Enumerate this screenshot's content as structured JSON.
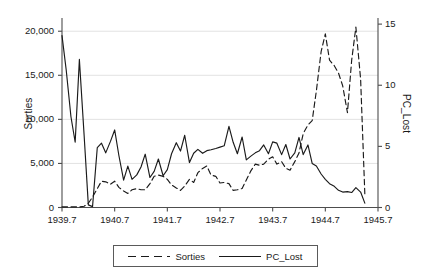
{
  "chart_data": {
    "type": "line",
    "title": "",
    "subtitle": "",
    "xlabel": "",
    "ylabel": "Sorties",
    "y2label": "PC_Lost",
    "xlim": [
      1939.7,
      1945.7
    ],
    "ylim": [
      0,
      21500
    ],
    "y2lim": [
      0,
      15.5
    ],
    "grid": true,
    "grid_axis": "y",
    "legend_position": "bottom-outside",
    "xticks": [
      "1939.7",
      "1940.7",
      "1941.7",
      "1942.7",
      "1943.7",
      "1944.7",
      "1945.7"
    ],
    "xtick_values": [
      1939.7,
      1940.7,
      1941.7,
      1942.7,
      1943.7,
      1944.7,
      1945.7
    ],
    "yticks": [
      "0",
      "5,000",
      "10,000",
      "15,000",
      "20,000"
    ],
    "ytick_values": [
      0,
      5000,
      10000,
      15000,
      20000
    ],
    "y2ticks": [
      "0",
      "5",
      "10",
      "15"
    ],
    "y2tick_values": [
      0,
      5,
      10,
      15
    ],
    "series": [
      {
        "name": "Sorties",
        "axis": "right",
        "style": "dashed",
        "color": "#1a1a1a",
        "x": [
          1939.7,
          1939.78,
          1939.87,
          1939.95,
          1940.03,
          1940.12,
          1940.2,
          1940.28,
          1940.37,
          1940.45,
          1940.53,
          1940.62,
          1940.7,
          1940.78,
          1940.87,
          1940.95,
          1941.03,
          1941.12,
          1941.2,
          1941.28,
          1941.37,
          1941.45,
          1941.53,
          1941.62,
          1941.7,
          1941.78,
          1941.87,
          1941.95,
          1942.03,
          1942.12,
          1942.2,
          1942.28,
          1942.37,
          1942.45,
          1942.53,
          1942.62,
          1942.7,
          1942.78,
          1942.87,
          1942.95,
          1943.03,
          1943.12,
          1943.2,
          1943.28,
          1943.37,
          1943.45,
          1943.53,
          1943.62,
          1943.7,
          1943.78,
          1943.87,
          1943.95,
          1944.03,
          1944.12,
          1944.2,
          1944.28,
          1944.37,
          1944.45,
          1944.53,
          1944.62,
          1944.7,
          1944.78,
          1944.87,
          1944.95,
          1945.03,
          1945.12,
          1945.2,
          1945.28,
          1945.37,
          1945.45
        ],
        "values": [
          0.05,
          0.05,
          0.05,
          0.05,
          0.05,
          0.1,
          0.35,
          0.85,
          1.55,
          2.15,
          2.1,
          1.9,
          2.15,
          1.65,
          1.35,
          1.15,
          1.45,
          1.55,
          1.45,
          1.45,
          1.95,
          2.55,
          2.65,
          2.55,
          2.3,
          1.85,
          1.6,
          1.4,
          1.75,
          2.3,
          2.05,
          2.85,
          3.2,
          3.4,
          2.65,
          2.55,
          2.0,
          2.05,
          1.95,
          1.4,
          1.45,
          1.55,
          2.25,
          2.95,
          3.55,
          3.45,
          3.55,
          3.95,
          4.15,
          3.55,
          3.75,
          3.2,
          3.05,
          3.75,
          4.45,
          6.05,
          6.75,
          7.1,
          9.55,
          12.75,
          14.2,
          12.05,
          11.6,
          11.0,
          9.95,
          7.75,
          12.05,
          14.75,
          10.5,
          1.1
        ]
      },
      {
        "name": "PC_Lost",
        "axis": "left",
        "style": "solid",
        "color": "#1a1a1a",
        "x": [
          1939.7,
          1939.78,
          1939.87,
          1939.95,
          1940.03,
          1940.12,
          1940.2,
          1940.28,
          1940.37,
          1940.45,
          1940.53,
          1940.62,
          1940.7,
          1940.78,
          1940.87,
          1940.95,
          1941.03,
          1941.12,
          1941.2,
          1941.28,
          1941.37,
          1941.45,
          1941.53,
          1941.62,
          1941.7,
          1941.78,
          1941.87,
          1941.95,
          1942.03,
          1942.12,
          1942.2,
          1942.28,
          1942.37,
          1942.45,
          1942.53,
          1942.62,
          1942.7,
          1942.78,
          1942.87,
          1942.95,
          1943.03,
          1943.12,
          1943.2,
          1943.28,
          1943.37,
          1943.45,
          1943.53,
          1943.62,
          1943.7,
          1943.78,
          1943.87,
          1943.95,
          1944.03,
          1944.12,
          1944.2,
          1944.28,
          1944.37,
          1944.45,
          1944.53,
          1944.62,
          1944.7,
          1944.78,
          1944.87,
          1944.95,
          1945.03,
          1945.12,
          1945.2,
          1945.28,
          1945.37,
          1945.45
        ],
        "values": [
          19500,
          15600,
          10300,
          7400,
          16800,
          8200,
          300,
          100,
          6800,
          7300,
          6200,
          7500,
          8800,
          5900,
          3100,
          4700,
          3200,
          3700,
          4600,
          6050,
          3400,
          4100,
          5500,
          3600,
          4300,
          6100,
          7350,
          6400,
          8200,
          5100,
          6150,
          6600,
          6150,
          6450,
          6550,
          6700,
          6850,
          7000,
          9200,
          7400,
          6100,
          8000,
          5400,
          5800,
          6200,
          6450,
          7100,
          6100,
          7450,
          7300,
          6000,
          7150,
          5500,
          6200,
          7950,
          6000,
          7100,
          5000,
          4700,
          3800,
          3200,
          2700,
          2400,
          1950,
          1750,
          1800,
          1700,
          2250,
          1750,
          500
        ]
      }
    ],
    "legend": [
      {
        "label": "Sorties",
        "style": "dashed"
      },
      {
        "label": "PC_Lost",
        "style": "solid"
      }
    ]
  },
  "colors": {
    "line": "#1a1a1a",
    "grid": "#e2e2e2",
    "axis": "#4d4d4d",
    "legend_border": "#5a5a5a",
    "background": "#ffffff"
  }
}
